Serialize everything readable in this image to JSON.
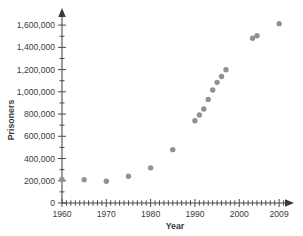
{
  "chart_data": {
    "type": "scatter",
    "title": "",
    "xlabel": "Year",
    "ylabel": "Prisoners",
    "xlim": [
      1960,
      2011
    ],
    "ylim": [
      0,
      1700000
    ],
    "grid": false,
    "legend": "none",
    "marker_color": "#919191",
    "axis_color": "#4a4a4a",
    "x_tick_labels": [
      "1960",
      "1970",
      "1980",
      "1990",
      "2000",
      "2009"
    ],
    "x_tick_values": [
      1960,
      1970,
      1980,
      1990,
      2000,
      2009
    ],
    "x_minor_tick_step": 1,
    "y_tick_labels": [
      "0",
      "200,000",
      "400,000",
      "600,000",
      "800,000",
      "1,000,000",
      "1,200,000",
      "1,400,000",
      "1,600,000"
    ],
    "y_tick_values": [
      0,
      200000,
      400000,
      600000,
      800000,
      1000000,
      1200000,
      1400000,
      1600000
    ],
    "y_minor_tick_step": 100000,
    "x": [
      1960,
      1965,
      1970,
      1975,
      1980,
      1985,
      1990,
      1991,
      1992,
      1993,
      1994,
      1995,
      1996,
      1997,
      2003,
      2004,
      2009
    ],
    "values": [
      212000,
      210000,
      196000,
      240000,
      316000,
      480000,
      740000,
      792000,
      846000,
      932000,
      1016000,
      1085000,
      1138000,
      1198000,
      1482000,
      1505000,
      1613000
    ],
    "points": [
      {
        "year": 1960,
        "prisoners": 212000
      },
      {
        "year": 1965,
        "prisoners": 210000
      },
      {
        "year": 1970,
        "prisoners": 196000
      },
      {
        "year": 1975,
        "prisoners": 240000
      },
      {
        "year": 1980,
        "prisoners": 316000
      },
      {
        "year": 1985,
        "prisoners": 480000
      },
      {
        "year": 1990,
        "prisoners": 740000
      },
      {
        "year": 1991,
        "prisoners": 792000
      },
      {
        "year": 1992,
        "prisoners": 846000
      },
      {
        "year": 1993,
        "prisoners": 932000
      },
      {
        "year": 1994,
        "prisoners": 1016000
      },
      {
        "year": 1995,
        "prisoners": 1085000
      },
      {
        "year": 1996,
        "prisoners": 1138000
      },
      {
        "year": 1997,
        "prisoners": 1198000
      },
      {
        "year": 2003,
        "prisoners": 1482000
      },
      {
        "year": 2004,
        "prisoners": 1505000
      },
      {
        "year": 2009,
        "prisoners": 1613000
      }
    ]
  }
}
